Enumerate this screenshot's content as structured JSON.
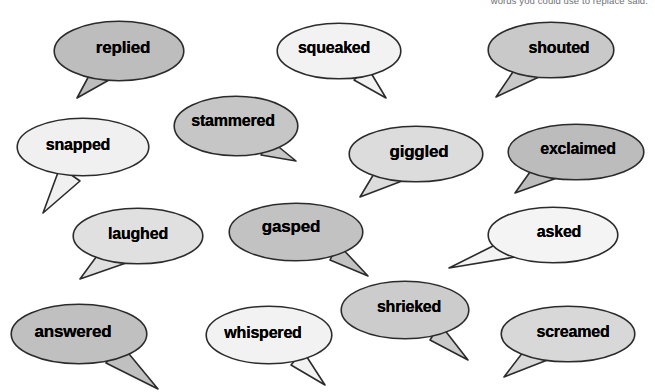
{
  "header": {
    "text": "words you could use to replace said."
  },
  "page": {
    "background_color": "#ffffff",
    "outline_color": "#2b2b2b",
    "text_color": "#000000"
  },
  "palette": {
    "white": "#fdfdfd",
    "near_white": "#f3f3f3",
    "light_gray": "#e6e6e6",
    "mid_gray": "#d4d4d4",
    "gray": "#c4c4c4",
    "dark_gray": "#b6b6b6"
  },
  "bubbles": [
    {
      "id": "replied",
      "label": "replied",
      "fill": "#bdbdbd",
      "x": 53,
      "y": 20,
      "w": 132,
      "h": 62,
      "font_size": 17,
      "text_dx": 4,
      "text_dy": -3,
      "tail": "down-left",
      "tail_points": "38,52 24,78 56,60"
    },
    {
      "id": "squeaked",
      "label": "squeaked",
      "fill": "#f2f2f2",
      "x": 276,
      "y": 22,
      "w": 126,
      "h": 58,
      "font_size": 16,
      "text_dx": -5,
      "text_dy": -3,
      "tail": "down-right",
      "tail_points": "92,46 110,76 78,58"
    },
    {
      "id": "shouted",
      "label": "shouted",
      "fill": "#c9c9c9",
      "x": 487,
      "y": 21,
      "w": 128,
      "h": 58,
      "font_size": 16,
      "text_dx": 8,
      "text_dy": -2,
      "tail": "down-left",
      "tail_points": "32,42 9,76 52,56"
    },
    {
      "id": "snapped",
      "label": "snapped",
      "fill": "#f0f0f0",
      "x": 16,
      "y": 117,
      "w": 134,
      "h": 60,
      "font_size": 16,
      "text_dx": -5,
      "text_dy": -2,
      "tail": "down-left",
      "tail_points": "44,50 27,96 64,64"
    },
    {
      "id": "stammered",
      "label": "stammered",
      "fill": "#c6c6c6",
      "x": 173,
      "y": 95,
      "w": 126,
      "h": 62,
      "font_size": 16,
      "text_dx": -3,
      "text_dy": -5,
      "tail": "down-right",
      "tail_points": "96,44 123,66 88,60"
    },
    {
      "id": "giggled",
      "label": "giggled",
      "fill": "#dcdcdc",
      "x": 348,
      "y": 125,
      "w": 136,
      "h": 58,
      "font_size": 17,
      "text_dx": 3,
      "text_dy": -2,
      "tail": "down-left",
      "tail_points": "30,42 12,72 54,56"
    },
    {
      "id": "exclaimed",
      "label": "exclaimed",
      "fill": "#bcbcbc",
      "x": 507,
      "y": 123,
      "w": 138,
      "h": 58,
      "font_size": 16,
      "text_dx": 2,
      "text_dy": -3,
      "tail": "down-left",
      "tail_points": "28,42 8,70 50,55"
    },
    {
      "id": "laughed",
      "label": "laughed",
      "fill": "#e0e0e0",
      "x": 72,
      "y": 207,
      "w": 132,
      "h": 58,
      "font_size": 16,
      "text_dx": 0,
      "text_dy": -2,
      "tail": "down-left",
      "tail_points": "30,42 8,72 54,56"
    },
    {
      "id": "gasped",
      "label": "gasped",
      "fill": "#c2c2c2",
      "x": 228,
      "y": 202,
      "w": 136,
      "h": 60,
      "font_size": 17,
      "text_dx": -5,
      "text_dy": -5,
      "tail": "down-right",
      "tail_points": "110,42 140,74 102,58"
    },
    {
      "id": "asked",
      "label": "asked",
      "fill": "#f4f4f4",
      "x": 487,
      "y": 206,
      "w": 132,
      "h": 58,
      "font_size": 16,
      "text_dx": 6,
      "text_dy": -3,
      "tail": "left",
      "tail_points": "30,28 -38,62 34,50"
    },
    {
      "id": "answered",
      "label": "answered",
      "fill": "#c0c0c0",
      "x": 10,
      "y": 303,
      "w": 138,
      "h": 62,
      "font_size": 17,
      "text_dx": -6,
      "text_dy": -2,
      "tail": "down-right",
      "tail_points": "110,40 148,86 96,60"
    },
    {
      "id": "whispered",
      "label": "whispered",
      "fill": "#f2f2f2",
      "x": 205,
      "y": 305,
      "w": 128,
      "h": 60,
      "font_size": 16,
      "text_dx": -6,
      "text_dy": -2,
      "tail": "down-right",
      "tail_points": "98,46 120,80 86,60"
    },
    {
      "id": "shrieked",
      "label": "shrieked",
      "fill": "#cccccc",
      "x": 340,
      "y": 280,
      "w": 130,
      "h": 60,
      "font_size": 16,
      "text_dx": 4,
      "text_dy": -3,
      "tail": "down-right",
      "tail_points": "100,44 128,80 90,60"
    },
    {
      "id": "screamed",
      "label": "screamed",
      "fill": "#d8d8d8",
      "x": 500,
      "y": 305,
      "w": 136,
      "h": 58,
      "font_size": 16,
      "text_dx": 5,
      "text_dy": -2,
      "tail": "down-left",
      "tail_points": "30,38 4,72 50,54"
    }
  ]
}
